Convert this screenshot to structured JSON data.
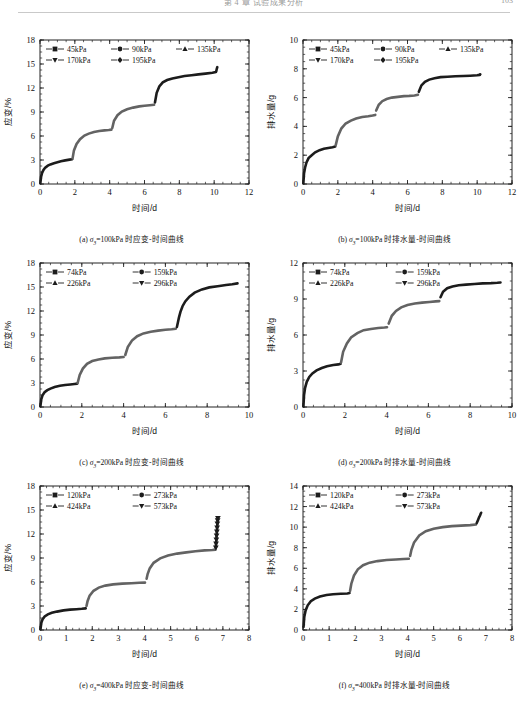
{
  "header": {
    "title": "第 4 章  试验成果分析",
    "page_number": "103"
  },
  "panels": [
    {
      "id": "a",
      "caption_prefix": "(a) ",
      "caption_sym": "σ",
      "caption_sub": "3",
      "caption_rest": "=100kPa 时应变-时间曲线"
    },
    {
      "id": "b",
      "caption_prefix": "(b) ",
      "caption_sym": "σ",
      "caption_sub": "3",
      "caption_rest": "=100kPa 时排水量-时间曲线"
    },
    {
      "id": "c",
      "caption_prefix": "(c) ",
      "caption_sym": "σ",
      "caption_sub": "3",
      "caption_rest": "=200kPa 时应变-时间曲线"
    },
    {
      "id": "d",
      "caption_prefix": "(d) ",
      "caption_sym": "σ",
      "caption_sub": "3",
      "caption_rest": "=200kPa 时排水量-时间曲线"
    },
    {
      "id": "e",
      "caption_prefix": "(e) ",
      "caption_sym": "σ",
      "caption_sub": "3",
      "caption_rest": "=400kPa 时应变-时间曲线"
    },
    {
      "id": "f",
      "caption_prefix": "(f) ",
      "caption_sym": "σ",
      "caption_sub": "3",
      "caption_rest": "=400kPa 时排水量-时间曲线"
    }
  ],
  "chart_data": [
    {
      "panel": "a",
      "type": "line",
      "title": "",
      "xlabel": "时间/d",
      "ylabel": "应变/%",
      "xlim": [
        0,
        12
      ],
      "ylim": [
        0,
        18
      ],
      "xticks": [
        0,
        2,
        4,
        6,
        8,
        10,
        12
      ],
      "yticks": [
        0,
        3,
        6,
        9,
        12,
        15,
        18
      ],
      "xminor_step": 0.5,
      "yminor_step": 0.75,
      "grid": false,
      "legend_position": "top-left",
      "legend": [
        {
          "name": "45kPa",
          "marker": "square"
        },
        {
          "name": "90kPa",
          "marker": "circle"
        },
        {
          "name": "135kPa",
          "marker": "triangle-up"
        },
        {
          "name": "170kPa",
          "marker": "triangle-down"
        },
        {
          "name": "195kPa",
          "marker": "diamond"
        }
      ],
      "series": [
        {
          "name": "45kPa",
          "color": "#1c1c1c",
          "x": [
            0.02,
            0.06,
            0.12,
            0.2,
            0.3,
            0.45,
            0.6,
            0.8,
            1.0,
            1.2,
            1.45,
            1.7,
            1.85
          ],
          "y": [
            0.1,
            0.9,
            1.4,
            1.75,
            2.05,
            2.3,
            2.45,
            2.6,
            2.72,
            2.85,
            2.95,
            3.05,
            3.1
          ]
        },
        {
          "name": "90kPa",
          "color": "#636363",
          "x": [
            1.87,
            1.95,
            2.1,
            2.3,
            2.55,
            2.8,
            3.1,
            3.4,
            3.7,
            3.95,
            4.1
          ],
          "y": [
            3.2,
            4.2,
            5.0,
            5.6,
            6.05,
            6.3,
            6.5,
            6.62,
            6.7,
            6.75,
            6.8
          ]
        },
        {
          "name": "135kPa",
          "color": "#636363",
          "x": [
            4.15,
            4.25,
            4.45,
            4.7,
            5.0,
            5.35,
            5.7,
            6.0,
            6.3,
            6.55
          ],
          "y": [
            7.0,
            7.9,
            8.6,
            9.05,
            9.35,
            9.55,
            9.7,
            9.78,
            9.85,
            9.9
          ]
        },
        {
          "name": "170kPa",
          "color": "#1c1c1c",
          "x": [
            6.6,
            6.7,
            6.85,
            7.05,
            7.3,
            7.6,
            7.95,
            8.3,
            8.7,
            9.1,
            9.5,
            9.9,
            10.1
          ],
          "y": [
            10.2,
            11.4,
            12.2,
            12.7,
            13.0,
            13.2,
            13.35,
            13.5,
            13.6,
            13.7,
            13.8,
            13.9,
            14.0
          ]
        },
        {
          "name": "195kPa",
          "color": "#1c1c1c",
          "x": [
            10.12,
            10.15,
            10.18
          ],
          "y": [
            14.1,
            14.4,
            14.6
          ]
        }
      ]
    },
    {
      "panel": "b",
      "type": "line",
      "title": "",
      "xlabel": "时间/d",
      "ylabel": "排水量/g",
      "xlim": [
        0,
        12
      ],
      "ylim": [
        0,
        10
      ],
      "xticks": [
        0,
        2,
        4,
        6,
        8,
        10,
        12
      ],
      "yticks": [
        0,
        2,
        4,
        6,
        8,
        10
      ],
      "xminor_step": 0.5,
      "yminor_step": 0.5,
      "grid": false,
      "legend_position": "top-left",
      "legend": [
        {
          "name": "45kPa",
          "marker": "square"
        },
        {
          "name": "90kPa",
          "marker": "circle"
        },
        {
          "name": "135kPa",
          "marker": "triangle-up"
        },
        {
          "name": "170kPa",
          "marker": "triangle-down"
        },
        {
          "name": "195kPa",
          "marker": "diamond"
        }
      ],
      "series": [
        {
          "name": "45kPa",
          "color": "#1c1c1c",
          "x": [
            0.02,
            0.06,
            0.12,
            0.2,
            0.32,
            0.5,
            0.7,
            0.95,
            1.2,
            1.45,
            1.7,
            1.85
          ],
          "y": [
            0.05,
            0.75,
            1.15,
            1.5,
            1.8,
            2.0,
            2.2,
            2.35,
            2.45,
            2.5,
            2.55,
            2.6
          ]
        },
        {
          "name": "90kPa",
          "color": "#636363",
          "x": [
            1.88,
            2.0,
            2.2,
            2.45,
            2.75,
            3.05,
            3.4,
            3.75,
            4.0,
            4.15
          ],
          "y": [
            2.7,
            3.3,
            3.85,
            4.2,
            4.4,
            4.55,
            4.65,
            4.7,
            4.75,
            4.8
          ]
        },
        {
          "name": "135kPa",
          "color": "#636363",
          "x": [
            4.2,
            4.35,
            4.55,
            4.8,
            5.1,
            5.45,
            5.8,
            6.1,
            6.4,
            6.6
          ],
          "y": [
            5.1,
            5.5,
            5.75,
            5.9,
            6.0,
            6.05,
            6.1,
            6.12,
            6.15,
            6.2
          ]
        },
        {
          "name": "170kPa",
          "color": "#1c1c1c",
          "x": [
            6.65,
            6.8,
            7.0,
            7.25,
            7.55,
            7.9,
            8.3,
            8.75,
            9.2,
            9.6,
            10.0,
            10.15
          ],
          "y": [
            6.4,
            6.85,
            7.1,
            7.25,
            7.35,
            7.42,
            7.45,
            7.48,
            7.5,
            7.52,
            7.55,
            7.58
          ]
        },
        {
          "name": "195kPa",
          "color": "#1c1c1c",
          "x": [
            10.16,
            10.18
          ],
          "y": [
            7.6,
            7.62
          ]
        }
      ]
    },
    {
      "panel": "c",
      "type": "line",
      "title": "",
      "xlabel": "时间/d",
      "ylabel": "应变/%",
      "xlim": [
        0,
        10
      ],
      "ylim": [
        0,
        18
      ],
      "xticks": [
        0,
        2,
        4,
        6,
        8,
        10
      ],
      "yticks": [
        0,
        3,
        6,
        9,
        12,
        15,
        18
      ],
      "xminor_step": 0.5,
      "yminor_step": 0.75,
      "grid": false,
      "legend_position": "top-left",
      "legend": [
        {
          "name": "74kPa",
          "marker": "square"
        },
        {
          "name": "159kPa",
          "marker": "circle"
        },
        {
          "name": "226kPa",
          "marker": "triangle-up"
        },
        {
          "name": "296kPa",
          "marker": "triangle-down"
        }
      ],
      "series": [
        {
          "name": "74kPa",
          "color": "#1c1c1c",
          "x": [
            0.02,
            0.06,
            0.12,
            0.22,
            0.35,
            0.5,
            0.7,
            0.95,
            1.2,
            1.45,
            1.65,
            1.78
          ],
          "y": [
            0.1,
            0.95,
            1.45,
            1.85,
            2.1,
            2.3,
            2.5,
            2.65,
            2.75,
            2.82,
            2.88,
            2.92
          ]
        },
        {
          "name": "159kPa",
          "color": "#636363",
          "x": [
            1.8,
            1.9,
            2.05,
            2.25,
            2.5,
            2.8,
            3.1,
            3.45,
            3.8,
            4.0
          ],
          "y": [
            3.0,
            4.0,
            4.8,
            5.4,
            5.75,
            5.95,
            6.08,
            6.15,
            6.2,
            6.25
          ]
        },
        {
          "name": "226kPa",
          "color": "#636363",
          "x": [
            4.08,
            4.2,
            4.4,
            4.65,
            4.95,
            5.3,
            5.65,
            6.0,
            6.3,
            6.5
          ],
          "y": [
            6.5,
            7.5,
            8.3,
            8.85,
            9.2,
            9.4,
            9.55,
            9.65,
            9.72,
            9.78
          ]
        },
        {
          "name": "296kPa",
          "color": "#1c1c1c",
          "x": [
            6.55,
            6.6,
            6.65,
            6.72,
            6.82,
            6.95,
            7.15,
            7.4,
            7.75,
            8.1,
            8.5,
            8.9,
            9.2,
            9.45
          ],
          "y": [
            10.0,
            10.6,
            11.2,
            11.9,
            12.6,
            13.2,
            13.8,
            14.3,
            14.7,
            14.95,
            15.1,
            15.25,
            15.35,
            15.45
          ]
        }
      ]
    },
    {
      "panel": "d",
      "type": "line",
      "title": "",
      "xlabel": "时间/d",
      "ylabel": "排水量/g",
      "xlim": [
        0,
        10
      ],
      "ylim": [
        0,
        12
      ],
      "xticks": [
        0,
        2,
        4,
        6,
        8,
        10
      ],
      "yticks": [
        0,
        3,
        6,
        9,
        12
      ],
      "xminor_step": 0.5,
      "yminor_step": 0.75,
      "grid": false,
      "legend_position": "top-left",
      "legend": [
        {
          "name": "74kPa",
          "marker": "square"
        },
        {
          "name": "159kPa",
          "marker": "circle"
        },
        {
          "name": "226kPa",
          "marker": "triangle-up"
        },
        {
          "name": "296kPa",
          "marker": "triangle-down"
        }
      ],
      "series": [
        {
          "name": "74kPa",
          "color": "#1c1c1c",
          "x": [
            0.02,
            0.05,
            0.1,
            0.18,
            0.3,
            0.45,
            0.65,
            0.9,
            1.15,
            1.45,
            1.7,
            1.8
          ],
          "y": [
            0.05,
            1.0,
            1.6,
            2.1,
            2.5,
            2.8,
            3.05,
            3.25,
            3.4,
            3.5,
            3.55,
            3.6
          ]
        },
        {
          "name": "159kPa",
          "color": "#636363",
          "x": [
            1.82,
            1.92,
            2.1,
            2.3,
            2.6,
            2.9,
            3.25,
            3.6,
            3.9,
            4.02
          ],
          "y": [
            3.7,
            4.6,
            5.3,
            5.8,
            6.15,
            6.4,
            6.5,
            6.58,
            6.62,
            6.65
          ]
        },
        {
          "name": "226kPa",
          "color": "#636363",
          "x": [
            4.1,
            4.25,
            4.45,
            4.7,
            5.0,
            5.35,
            5.7,
            6.05,
            6.35,
            6.52
          ],
          "y": [
            6.95,
            7.6,
            8.0,
            8.3,
            8.5,
            8.62,
            8.7,
            8.75,
            8.8,
            8.82
          ]
        },
        {
          "name": "296kPa",
          "color": "#1c1c1c",
          "x": [
            6.58,
            6.7,
            6.9,
            7.15,
            7.45,
            7.8,
            8.2,
            8.6,
            9.0,
            9.3,
            9.45
          ],
          "y": [
            9.15,
            9.6,
            9.9,
            10.05,
            10.15,
            10.2,
            10.25,
            10.3,
            10.32,
            10.35,
            10.38
          ]
        }
      ]
    },
    {
      "panel": "e",
      "type": "line",
      "title": "",
      "xlabel": "时间/d",
      "ylabel": "应变/%",
      "xlim": [
        0,
        8
      ],
      "ylim": [
        0,
        18
      ],
      "xticks": [
        0,
        1,
        2,
        3,
        4,
        5,
        6,
        7,
        8
      ],
      "yticks": [
        0,
        3,
        6,
        9,
        12,
        15,
        18
      ],
      "xminor_step": 0.25,
      "yminor_step": 0.75,
      "grid": false,
      "legend_position": "top-left",
      "legend": [
        {
          "name": "120kPa",
          "marker": "square"
        },
        {
          "name": "273kPa",
          "marker": "circle"
        },
        {
          "name": "424kPa",
          "marker": "triangle-up"
        },
        {
          "name": "573kPa",
          "marker": "triangle-down"
        }
      ],
      "series": [
        {
          "name": "120kPa",
          "color": "#1c1c1c",
          "x": [
            0.02,
            0.05,
            0.1,
            0.18,
            0.3,
            0.45,
            0.65,
            0.9,
            1.15,
            1.4,
            1.6,
            1.75
          ],
          "y": [
            0.1,
            0.9,
            1.35,
            1.7,
            1.95,
            2.15,
            2.3,
            2.45,
            2.55,
            2.6,
            2.65,
            2.7
          ]
        },
        {
          "name": "273kPa",
          "color": "#636363",
          "x": [
            1.78,
            1.82,
            1.9,
            2.05,
            2.25,
            2.5,
            2.8,
            3.15,
            3.5,
            3.8,
            4.02
          ],
          "y": [
            3.0,
            3.6,
            4.3,
            4.9,
            5.3,
            5.55,
            5.7,
            5.8,
            5.85,
            5.9,
            5.92
          ]
        },
        {
          "name": "424kPa",
          "color": "#636363",
          "x": [
            4.08,
            4.12,
            4.2,
            4.35,
            4.6,
            4.9,
            5.25,
            5.6,
            5.95,
            6.3,
            6.6,
            6.72
          ],
          "y": [
            6.4,
            7.0,
            7.7,
            8.4,
            8.95,
            9.3,
            9.55,
            9.7,
            9.85,
            9.95,
            10.0,
            10.05
          ]
        },
        {
          "name": "573kPa",
          "color": "#1c1c1c",
          "x": [
            6.73,
            6.74,
            6.75,
            6.76,
            6.77,
            6.78,
            6.79,
            6.8,
            6.81
          ],
          "y": [
            10.3,
            10.8,
            11.3,
            11.8,
            12.3,
            12.8,
            13.3,
            13.7,
            14.0
          ]
        }
      ]
    },
    {
      "panel": "f",
      "type": "line",
      "title": "",
      "xlabel": "时间/d",
      "ylabel": "排水量/g",
      "xlim": [
        0,
        8
      ],
      "ylim": [
        0,
        14
      ],
      "xticks": [
        0,
        1,
        2,
        3,
        4,
        5,
        6,
        7,
        8
      ],
      "yticks": [
        0,
        2,
        4,
        6,
        8,
        10,
        12,
        14
      ],
      "xminor_step": 0.25,
      "yminor_step": 0.5,
      "grid": false,
      "legend_position": "top-left",
      "legend": [
        {
          "name": "120kPa",
          "marker": "square"
        },
        {
          "name": "273kPa",
          "marker": "circle"
        },
        {
          "name": "424kPa",
          "marker": "triangle-up"
        },
        {
          "name": "573kPa",
          "marker": "triangle-down"
        }
      ],
      "series": [
        {
          "name": "120kPa",
          "color": "#1c1c1c",
          "x": [
            0.02,
            0.05,
            0.1,
            0.18,
            0.3,
            0.45,
            0.65,
            0.9,
            1.15,
            1.45,
            1.7,
            1.78
          ],
          "y": [
            0.3,
            1.3,
            1.9,
            2.4,
            2.8,
            3.05,
            3.25,
            3.4,
            3.48,
            3.52,
            3.55,
            3.6
          ]
        },
        {
          "name": "273kPa",
          "color": "#636363",
          "x": [
            1.8,
            1.85,
            1.95,
            2.1,
            2.3,
            2.55,
            2.85,
            3.2,
            3.55,
            3.85,
            4.05
          ],
          "y": [
            3.8,
            4.5,
            5.3,
            5.9,
            6.3,
            6.55,
            6.7,
            6.8,
            6.85,
            6.9,
            6.92
          ]
        },
        {
          "name": "424kPa",
          "color": "#636363",
          "x": [
            4.1,
            4.15,
            4.25,
            4.45,
            4.7,
            5.0,
            5.35,
            5.7,
            6.05,
            6.4,
            6.62
          ],
          "y": [
            7.2,
            7.8,
            8.5,
            9.2,
            9.6,
            9.85,
            10.0,
            10.1,
            10.15,
            10.2,
            10.25
          ]
        },
        {
          "name": "573kPa",
          "color": "#1c1c1c",
          "x": [
            6.65,
            6.7,
            6.74,
            6.78,
            6.8,
            6.82
          ],
          "y": [
            10.4,
            10.7,
            10.95,
            11.15,
            11.3,
            11.4
          ]
        }
      ]
    }
  ]
}
